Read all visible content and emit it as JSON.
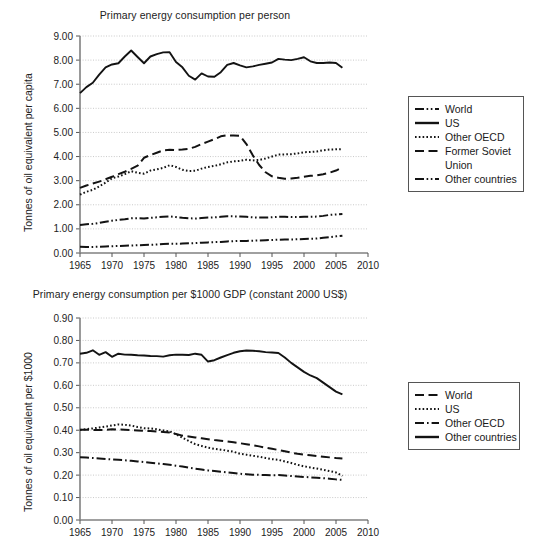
{
  "page": {
    "background": "#ffffff",
    "ink": "#1a1a1a"
  },
  "charts": [
    {
      "id": "per-person",
      "title": "Primary energy consumption per person",
      "ylabel": "Tonnes of oil equivalent per capita",
      "xlabel": "",
      "legend": {
        "position": "right",
        "entries": [
          {
            "label": "World",
            "style": "dash-dot-dot"
          },
          {
            "label": "US",
            "style": "solid"
          },
          {
            "label": "Other OECD",
            "style": "dotted"
          },
          {
            "label": "Former Soviet",
            "style": "dashed",
            "label2": "Union"
          },
          {
            "label": "Other countries",
            "style": "dash-dot-dot"
          }
        ]
      }
    },
    {
      "id": "per-gdp",
      "title": "Primary energy consumption per $1000 GDP (constant 2000 US$)",
      "ylabel": "Tonnes of oil equivalent per $1000",
      "xlabel": "",
      "legend": {
        "position": "right",
        "entries": [
          {
            "label": "World",
            "style": "dashed"
          },
          {
            "label": "US",
            "style": "dotted"
          },
          {
            "label": "Other OECD",
            "style": "dash-dot"
          },
          {
            "label": "Other countries",
            "style": "solid"
          }
        ]
      }
    }
  ],
  "chart_data": [
    {
      "type": "line",
      "title": "Primary energy consumption per person",
      "xlabel": "",
      "ylabel": "Tonnes of oil equivalent per capita",
      "xlim": [
        1965,
        2010
      ],
      "ylim": [
        0.0,
        9.0
      ],
      "xticks": [
        1965,
        1970,
        1975,
        1980,
        1985,
        1990,
        1995,
        2000,
        2005,
        2010
      ],
      "yticks": [
        "0.00",
        "1.00",
        "2.00",
        "3.00",
        "4.00",
        "5.00",
        "6.00",
        "7.00",
        "8.00",
        "9.00"
      ],
      "grid": true,
      "legend_position": "right",
      "x": [
        1965,
        1966,
        1967,
        1968,
        1969,
        1970,
        1971,
        1972,
        1973,
        1974,
        1975,
        1976,
        1977,
        1978,
        1979,
        1980,
        1981,
        1982,
        1983,
        1984,
        1985,
        1986,
        1987,
        1988,
        1989,
        1990,
        1991,
        1992,
        1993,
        1994,
        1995,
        1996,
        1997,
        1998,
        1999,
        2000,
        2001,
        2002,
        2003,
        2004,
        2005,
        2006
      ],
      "series": [
        {
          "name": "World",
          "style": "dash-dot-dot",
          "values": [
            1.16,
            1.19,
            1.21,
            1.25,
            1.3,
            1.34,
            1.37,
            1.4,
            1.44,
            1.44,
            1.43,
            1.46,
            1.48,
            1.5,
            1.52,
            1.49,
            1.46,
            1.44,
            1.43,
            1.45,
            1.47,
            1.48,
            1.5,
            1.52,
            1.52,
            1.51,
            1.5,
            1.48,
            1.47,
            1.47,
            1.48,
            1.5,
            1.5,
            1.49,
            1.49,
            1.5,
            1.5,
            1.51,
            1.54,
            1.58,
            1.6,
            1.62
          ]
        },
        {
          "name": "US",
          "style": "solid",
          "values": [
            6.63,
            6.88,
            7.06,
            7.4,
            7.7,
            7.82,
            7.87,
            8.15,
            8.4,
            8.13,
            7.87,
            8.15,
            8.25,
            8.32,
            8.33,
            7.92,
            7.7,
            7.35,
            7.19,
            7.45,
            7.32,
            7.31,
            7.5,
            7.8,
            7.88,
            7.78,
            7.7,
            7.74,
            7.8,
            7.85,
            7.9,
            8.05,
            8.02,
            8.0,
            8.05,
            8.12,
            7.95,
            7.88,
            7.88,
            7.9,
            7.88,
            7.68
          ]
        },
        {
          "name": "Other OECD",
          "style": "dotted",
          "values": [
            2.42,
            2.54,
            2.62,
            2.76,
            2.92,
            3.1,
            3.17,
            3.27,
            3.39,
            3.33,
            3.29,
            3.42,
            3.47,
            3.53,
            3.64,
            3.57,
            3.45,
            3.4,
            3.41,
            3.5,
            3.57,
            3.61,
            3.68,
            3.76,
            3.8,
            3.82,
            3.87,
            3.84,
            3.86,
            3.92,
            4.0,
            4.08,
            4.09,
            4.1,
            4.13,
            4.18,
            4.19,
            4.21,
            4.26,
            4.29,
            4.3,
            4.31
          ]
        },
        {
          "name": "Former Soviet Union",
          "style": "dashed",
          "values": [
            2.7,
            2.8,
            2.88,
            2.96,
            3.06,
            3.16,
            3.27,
            3.37,
            3.49,
            3.62,
            3.95,
            4.06,
            4.16,
            4.26,
            4.28,
            4.27,
            4.29,
            4.32,
            4.4,
            4.52,
            4.62,
            4.72,
            4.84,
            4.88,
            4.87,
            4.86,
            4.52,
            4.05,
            3.65,
            3.35,
            3.18,
            3.12,
            3.08,
            3.09,
            3.12,
            3.16,
            3.2,
            3.22,
            3.27,
            3.33,
            3.42,
            3.55
          ]
        },
        {
          "name": "Other countries",
          "style": "dash-dot-dot",
          "values": [
            0.26,
            0.25,
            0.25,
            0.26,
            0.27,
            0.28,
            0.29,
            0.3,
            0.31,
            0.32,
            0.33,
            0.34,
            0.35,
            0.37,
            0.38,
            0.38,
            0.39,
            0.4,
            0.41,
            0.43,
            0.44,
            0.45,
            0.46,
            0.48,
            0.49,
            0.5,
            0.5,
            0.51,
            0.52,
            0.53,
            0.54,
            0.55,
            0.56,
            0.56,
            0.57,
            0.58,
            0.59,
            0.6,
            0.63,
            0.66,
            0.69,
            0.72
          ]
        }
      ]
    },
    {
      "type": "line",
      "title": "Primary energy consumption per $1000 GDP (constant 2000 US$)",
      "xlabel": "",
      "ylabel": "Tonnes of oil equivalent per $1000",
      "xlim": [
        1965,
        2010
      ],
      "ylim": [
        0.0,
        0.9
      ],
      "xticks": [
        1965,
        1970,
        1975,
        1980,
        1985,
        1990,
        1995,
        2000,
        2005,
        2010
      ],
      "yticks": [
        "0.00",
        "0.10",
        "0.20",
        "0.30",
        "0.40",
        "0.50",
        "0.60",
        "0.70",
        "0.80",
        "0.90"
      ],
      "grid": true,
      "legend_position": "right",
      "x": [
        1965,
        1966,
        1967,
        1968,
        1969,
        1970,
        1971,
        1972,
        1973,
        1974,
        1975,
        1976,
        1977,
        1978,
        1979,
        1980,
        1981,
        1982,
        1983,
        1984,
        1985,
        1986,
        1987,
        1988,
        1989,
        1990,
        1991,
        1992,
        1993,
        1994,
        1995,
        1996,
        1997,
        1998,
        1999,
        2000,
        2001,
        2002,
        2003,
        2004,
        2005,
        2006
      ],
      "series": [
        {
          "name": "World",
          "style": "dashed",
          "values": [
            0.402,
            0.402,
            0.401,
            0.401,
            0.402,
            0.404,
            0.403,
            0.402,
            0.401,
            0.399,
            0.397,
            0.396,
            0.394,
            0.392,
            0.39,
            0.383,
            0.376,
            0.372,
            0.368,
            0.364,
            0.36,
            0.356,
            0.353,
            0.35,
            0.346,
            0.342,
            0.338,
            0.333,
            0.328,
            0.322,
            0.317,
            0.312,
            0.306,
            0.3,
            0.295,
            0.291,
            0.288,
            0.285,
            0.282,
            0.279,
            0.276,
            0.274
          ]
        },
        {
          "name": "US",
          "style": "dotted",
          "values": [
            0.401,
            0.405,
            0.408,
            0.412,
            0.416,
            0.421,
            0.426,
            0.424,
            0.421,
            0.414,
            0.409,
            0.408,
            0.404,
            0.399,
            0.395,
            0.382,
            0.367,
            0.352,
            0.338,
            0.33,
            0.322,
            0.317,
            0.313,
            0.309,
            0.304,
            0.295,
            0.291,
            0.286,
            0.282,
            0.276,
            0.271,
            0.268,
            0.261,
            0.254,
            0.246,
            0.239,
            0.234,
            0.229,
            0.224,
            0.218,
            0.212,
            0.197
          ]
        },
        {
          "name": "Other OECD",
          "style": "dash-dot",
          "values": [
            0.28,
            0.278,
            0.276,
            0.274,
            0.272,
            0.27,
            0.268,
            0.266,
            0.264,
            0.261,
            0.258,
            0.255,
            0.252,
            0.249,
            0.246,
            0.242,
            0.238,
            0.233,
            0.229,
            0.225,
            0.221,
            0.218,
            0.215,
            0.212,
            0.209,
            0.206,
            0.204,
            0.202,
            0.201,
            0.2,
            0.199,
            0.2,
            0.198,
            0.196,
            0.194,
            0.192,
            0.19,
            0.188,
            0.186,
            0.184,
            0.181,
            0.179
          ]
        },
        {
          "name": "Other countries",
          "style": "solid",
          "values": [
            0.741,
            0.745,
            0.756,
            0.736,
            0.748,
            0.727,
            0.741,
            0.737,
            0.736,
            0.734,
            0.733,
            0.731,
            0.73,
            0.728,
            0.734,
            0.737,
            0.736,
            0.735,
            0.741,
            0.736,
            0.706,
            0.712,
            0.724,
            0.735,
            0.745,
            0.752,
            0.755,
            0.754,
            0.752,
            0.748,
            0.746,
            0.744,
            0.724,
            0.7,
            0.68,
            0.66,
            0.644,
            0.632,
            0.612,
            0.592,
            0.572,
            0.56
          ]
        }
      ]
    }
  ]
}
